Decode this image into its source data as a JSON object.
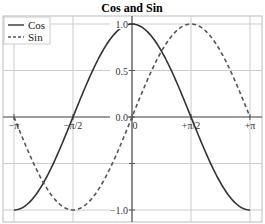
{
  "chart_data": {
    "type": "line",
    "title": "Cos and Sin",
    "xlabel": "",
    "ylabel": "",
    "xlim": [
      -3.3,
      3.45
    ],
    "ylim": [
      -1.1,
      1.1
    ],
    "grid": true,
    "legend_position": "upper left",
    "x_ticks": [
      {
        "value": -3.14159,
        "label": "−π"
      },
      {
        "value": -1.5708,
        "label": "−π/2"
      },
      {
        "value": 0,
        "label": "0"
      },
      {
        "value": 1.5708,
        "label": "+π/2"
      },
      {
        "value": 3.14159,
        "label": "+π"
      }
    ],
    "y_ticks": [
      {
        "value": -1.0,
        "label": "−1.0"
      },
      {
        "value": -0.5,
        "label": ""
      },
      {
        "value": 0.0,
        "label": "0.0"
      },
      {
        "value": 0.5,
        "label": "0.5"
      },
      {
        "value": 1.0,
        "label": "1.0"
      }
    ],
    "series": [
      {
        "name": "Cos",
        "style": "solid",
        "color": "#333333",
        "function": "cos",
        "x": [
          -3.14159,
          -1.5708,
          0,
          1.5708,
          3.14159
        ],
        "values": [
          -1,
          0,
          1,
          0,
          -1
        ]
      },
      {
        "name": "Sin",
        "style": "dashed",
        "color": "#555555",
        "function": "sin",
        "x": [
          -3.14159,
          -1.5708,
          0,
          1.5708,
          3.14159
        ],
        "values": [
          0,
          -1,
          0,
          1,
          0
        ]
      }
    ]
  }
}
